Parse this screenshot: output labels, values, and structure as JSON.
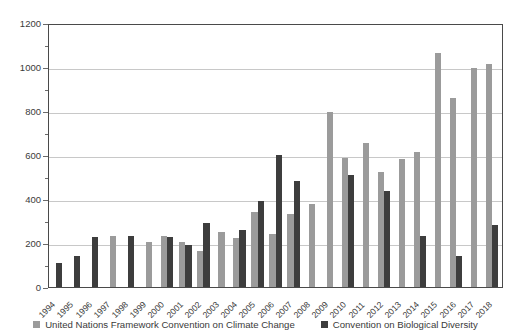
{
  "chart_data": {
    "type": "bar",
    "title": "",
    "xlabel": "",
    "ylabel": "",
    "ylim": [
      0,
      1200
    ],
    "ytick_step": 200,
    "yminor_step": 100,
    "grid": true,
    "legend_position": "bottom",
    "yticks": [
      "0",
      "200",
      "400",
      "600",
      "800",
      "1000",
      "1200"
    ],
    "categories": [
      "1994",
      "1995",
      "1996",
      "1997",
      "1998",
      "1999",
      "2000",
      "2001",
      "2002",
      "2003",
      "2004",
      "2005",
      "2006",
      "2007",
      "2008",
      "2009",
      "2010",
      "2011",
      "2012",
      "2013",
      "2014",
      "2015",
      "2016",
      "2017",
      "2018"
    ],
    "series": [
      {
        "name": "United Nations Framework Convention on Climate Change",
        "color": "#9b9b9b",
        "values": [
          0,
          0,
          0,
          232,
          0,
          206,
          233,
          205,
          164,
          252,
          222,
          340,
          241,
          331,
          378,
          795,
          588,
          655,
          524,
          581,
          613,
          1065,
          857,
          995,
          1015
        ]
      },
      {
        "name": "Convention on Biological Diversity",
        "color": "#3d3d3d",
        "values": [
          109,
          143,
          228,
          0,
          234,
          0,
          226,
          189,
          290,
          0,
          261,
          391,
          598,
          480,
          0,
          0,
          508,
          0,
          437,
          0,
          232,
          0,
          143,
          0,
          283
        ]
      }
    ]
  },
  "legend": {
    "items": [
      {
        "label": "United Nations Framework Convention on Climate Change",
        "swatch": "s0"
      },
      {
        "label": "Convention on Biological Diversity",
        "swatch": "s1"
      }
    ]
  }
}
